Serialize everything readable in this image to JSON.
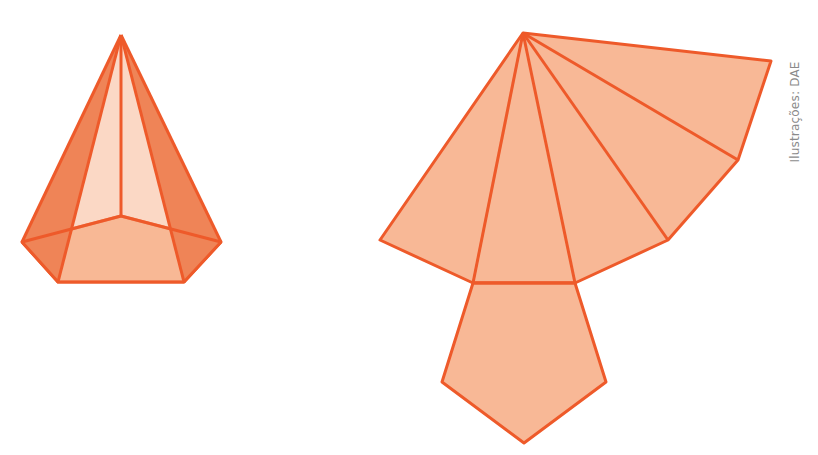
{
  "figure": {
    "credit": "Ilustrações: DAE",
    "colors": {
      "edge": "#ee5a2a",
      "face_light": "#f8b896",
      "face_mid": "#f5a07a",
      "face_dark": "#ef8457",
      "background": "#ffffff"
    },
    "pyramid": {
      "description": "Pentagonal pyramid (3D view)",
      "apex": [
        121,
        35
      ],
      "base": [
        [
          22,
          242
        ],
        [
          58,
          282
        ],
        [
          184,
          282
        ],
        [
          221,
          242
        ],
        [
          121,
          216
        ]
      ]
    },
    "net": {
      "description": "Net of pentagonal pyramid",
      "apex": [
        523,
        33
      ],
      "fan_points": [
        [
          771,
          61
        ],
        [
          738,
          160
        ],
        [
          668,
          240
        ],
        [
          575,
          283
        ],
        [
          473,
          283
        ],
        [
          380,
          240
        ]
      ],
      "base_pentagon": [
        [
          473,
          283
        ],
        [
          575,
          283
        ],
        [
          606,
          382
        ],
        [
          524,
          443
        ],
        [
          442,
          382
        ]
      ]
    }
  }
}
